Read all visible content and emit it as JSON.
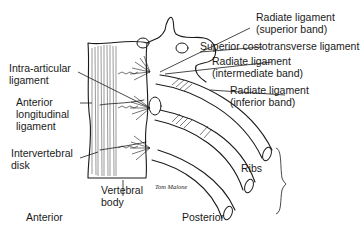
{
  "figure": {
    "labels": {
      "radiate_superior_1": "Radiate ligament",
      "radiate_superior_2": "(superior band)",
      "superior_costotransverse": "Superior costotransverse ligament",
      "radiate_intermediate_1": "Radiate ligament",
      "radiate_intermediate_2": "(intermediate band)",
      "radiate_inferior_1": "Radiate ligament",
      "radiate_inferior_2": "(inferior band)",
      "intra_articular_1": "Intra-articular",
      "intra_articular_2": "ligament",
      "anterior_longitudinal_1": "Anterior",
      "anterior_longitudinal_2": "longitudinal",
      "anterior_longitudinal_3": "ligament",
      "intervertebral_1": "Intervertebral",
      "intervertebral_2": "disk",
      "vertebral_body_1": "Vertebral",
      "vertebral_body_2": "body",
      "ribs": "Ribs",
      "anterior": "Anterior",
      "posterior": "Posterior"
    },
    "signature": "Tom Malone",
    "colors": {
      "ink": "#1a1a1a",
      "background": "#ffffff"
    }
  }
}
